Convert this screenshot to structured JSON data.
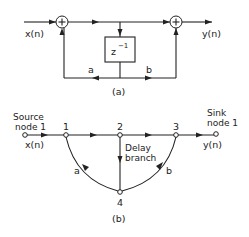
{
  "diagram_a": {
    "caption": "(a)",
    "input_label": "x(n)",
    "output_label": "y(n)",
    "adders": [
      {
        "id": "left-adder",
        "symbol": "+"
      },
      {
        "id": "right-adder",
        "symbol": "+"
      }
    ],
    "delay_box": {
      "base": "z",
      "exponent": "−1"
    },
    "coefficient_a": "a",
    "coefficient_b": "b"
  },
  "diagram_b": {
    "caption": "(b)",
    "source_label_line1": "Source",
    "source_label_line2": "node 1",
    "sink_label_line1": "Sink",
    "sink_label_line2": "node 1",
    "input_label": "x(n)",
    "output_label": "y(n)",
    "nodes": [
      "1",
      "2",
      "3",
      "4"
    ],
    "delay_label_line1": "Delay",
    "delay_label_line2": "branch",
    "branch_a": "a",
    "branch_b": "b"
  },
  "colors": {
    "ink": "#222222",
    "background": "#ffffff"
  }
}
